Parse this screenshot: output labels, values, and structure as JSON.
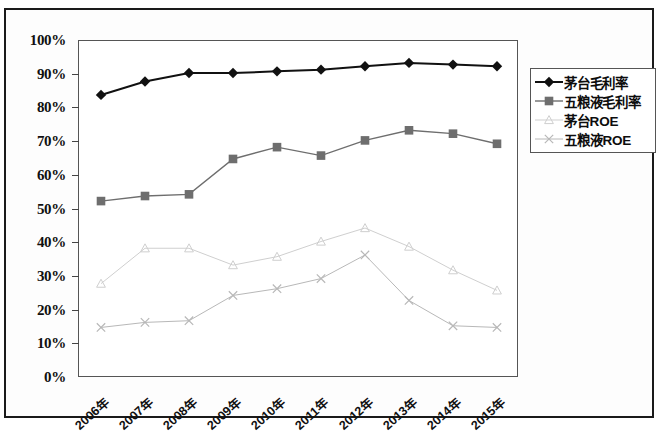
{
  "chart_data": {
    "type": "line",
    "title": "",
    "subtitle": "",
    "xlabel": "",
    "ylabel": "",
    "ylim": [
      0,
      100
    ],
    "y_ticks": [
      "0%",
      "10%",
      "20%",
      "30%",
      "40%",
      "50%",
      "60%",
      "70%",
      "80%",
      "90%",
      "100%"
    ],
    "y_tick_values": [
      0,
      10,
      20,
      30,
      40,
      50,
      60,
      70,
      80,
      90,
      100
    ],
    "grid": false,
    "legend_position": "right",
    "categories": [
      "2006年",
      "2007年",
      "2008年",
      "2009年",
      "2010年",
      "2011年",
      "2012年",
      "2013年",
      "2014年",
      "2015年"
    ],
    "series": [
      {
        "name": "茅台毛利率",
        "marker": "diamond",
        "color": "#111111",
        "line_width": 2.0,
        "values": [
          84,
          88,
          90.5,
          90.5,
          91,
          91.5,
          92.5,
          93.5,
          93,
          92.5
        ]
      },
      {
        "name": "五粮液毛利率",
        "marker": "square",
        "color": "#6e6e6e",
        "line_width": 1.4,
        "values": [
          52.5,
          54,
          54.5,
          65,
          68.5,
          66,
          70.5,
          73.5,
          72.5,
          69.5
        ]
      },
      {
        "name": "茅台ROE",
        "marker": "triangle",
        "color": "#cfcfcf",
        "line_width": 1.0,
        "values": [
          28,
          38.5,
          38.5,
          33.5,
          36,
          40.5,
          44.5,
          39,
          32,
          26
        ]
      },
      {
        "name": "五粮液ROE",
        "marker": "cross",
        "color": "#b8b8b8",
        "line_width": 1.0,
        "values": [
          15,
          16.5,
          17,
          24.5,
          26.5,
          29.5,
          36.5,
          23,
          15.5,
          15
        ]
      }
    ]
  },
  "legend": {
    "items": [
      {
        "label": "茅台毛利率"
      },
      {
        "label": "五粮液毛利率"
      },
      {
        "label": "茅台ROE"
      },
      {
        "label": "五粮液ROE"
      }
    ]
  }
}
